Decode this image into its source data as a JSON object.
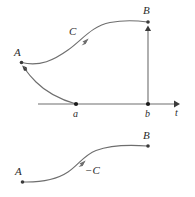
{
  "figure": {
    "stroke_color": "#6e6e6e",
    "marker_color": "#3a3a3a",
    "text_color": "#2b2b2b",
    "background_color": "#ffffff",
    "width": 195,
    "height": 197
  },
  "upper_diagram": {
    "labels": {
      "point_a_label": "A",
      "point_b_label": "B",
      "curve_label": "C",
      "axis_tick_a": "a",
      "axis_tick_b": "b",
      "axis_label": "t"
    },
    "points": {
      "A": {
        "x": 21,
        "y": 62
      },
      "B": {
        "x": 148,
        "y": 22
      },
      "a": {
        "x": 76,
        "y": 104
      },
      "b": {
        "x": 148,
        "y": 104
      }
    },
    "axis": {
      "y": 104,
      "x_start": 38,
      "x_end": 178,
      "arrow": "right"
    },
    "vertical_segment": {
      "x": 148,
      "y_start": 104,
      "y_end": 27,
      "arrow": "up"
    },
    "curve_C": {
      "from": "A",
      "to": "B",
      "direction_marker_at": {
        "x": 85,
        "y": 41
      },
      "marker_direction": "up-right"
    },
    "curve_a_to_A": {
      "from": "a",
      "to": "A",
      "arrow_at": {
        "x": 23,
        "y": 68
      },
      "arrow_direction": "up-left"
    }
  },
  "lower_diagram": {
    "labels": {
      "point_a_label": "A",
      "point_b_label": "B",
      "curve_label": "−C"
    },
    "points": {
      "A": {
        "x": 22,
        "y": 182
      },
      "B": {
        "x": 148,
        "y": 146
      }
    },
    "curve_minus_C": {
      "from": "A",
      "to": "B",
      "direction_marker_at": {
        "x": 82,
        "y": 163
      },
      "marker_direction": "up-right"
    }
  }
}
